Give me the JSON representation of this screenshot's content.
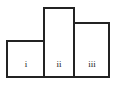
{
  "figure": {
    "kind": "bar-diagram",
    "background_color": "#ffffff",
    "stroke_color": "#232323",
    "fill_color": "#ffffff",
    "label_color": "#1a1a1a"
  },
  "chart_data": {
    "type": "bar",
    "title": "",
    "subtitle": "",
    "xlabel": "",
    "ylabel": "",
    "categories": [
      "i",
      "ii",
      "iii"
    ],
    "values": [
      36,
      69,
      54
    ],
    "ylim": [
      0,
      77
    ],
    "grid": false,
    "legend": null,
    "annotations": [],
    "tick_labels": {
      "x": [
        "i",
        "ii",
        "iii"
      ],
      "y": []
    },
    "bars": [
      {
        "label": "i",
        "value": 36,
        "x": 7,
        "y": 41,
        "width": 37,
        "height": 36
      },
      {
        "label": "ii",
        "value": 69,
        "x": 44,
        "y": 8,
        "width": 30,
        "height": 69
      },
      {
        "label": "iii",
        "value": 54,
        "x": 74,
        "y": 23,
        "width": 35,
        "height": 54
      }
    ],
    "label_positions": [
      {
        "text": "i",
        "x": 26,
        "y": 65
      },
      {
        "text": "ii",
        "x": 59,
        "y": 65
      },
      {
        "text": "iii",
        "x": 92,
        "y": 65
      }
    ]
  }
}
